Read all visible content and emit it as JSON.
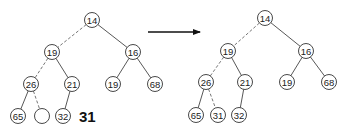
{
  "before_tree": {
    "insert_value": "31",
    "nodes": [
      {
        "id": "a",
        "label": "14",
        "x": 92,
        "y": 20
      },
      {
        "id": "b",
        "label": "19",
        "x": 52,
        "y": 52
      },
      {
        "id": "c",
        "label": "16",
        "x": 133,
        "y": 52
      },
      {
        "id": "d",
        "label": "26",
        "x": 31,
        "y": 84
      },
      {
        "id": "e",
        "label": "21",
        "x": 72,
        "y": 84
      },
      {
        "id": "f",
        "label": "19",
        "x": 113,
        "y": 84
      },
      {
        "id": "g",
        "label": "68",
        "x": 155,
        "y": 84
      },
      {
        "id": "h",
        "label": "65",
        "x": 18,
        "y": 116
      },
      {
        "id": "i",
        "label": "",
        "x": 42,
        "y": 116
      },
      {
        "id": "j",
        "label": "32",
        "x": 63,
        "y": 116
      }
    ],
    "edges": [
      {
        "from": "a",
        "to": "b",
        "dashed": true
      },
      {
        "from": "a",
        "to": "c",
        "dashed": false
      },
      {
        "from": "b",
        "to": "d",
        "dashed": true
      },
      {
        "from": "b",
        "to": "e",
        "dashed": false
      },
      {
        "from": "c",
        "to": "f",
        "dashed": false
      },
      {
        "from": "c",
        "to": "g",
        "dashed": false
      },
      {
        "from": "d",
        "to": "h",
        "dashed": false
      },
      {
        "from": "d",
        "to": "i",
        "dashed": true
      },
      {
        "from": "e",
        "to": "j",
        "dashed": false
      }
    ],
    "label_pos": {
      "x": 79,
      "y": 116
    }
  },
  "arrow": {
    "x1": 148,
    "y1": 32,
    "x2": 200,
    "y2": 32
  },
  "after_tree": {
    "nodes": [
      {
        "id": "a",
        "label": "14",
        "x": 265,
        "y": 18
      },
      {
        "id": "b",
        "label": "19",
        "x": 228,
        "y": 51
      },
      {
        "id": "c",
        "label": "16",
        "x": 306,
        "y": 51
      },
      {
        "id": "d",
        "label": "26",
        "x": 206,
        "y": 82
      },
      {
        "id": "e",
        "label": "21",
        "x": 245,
        "y": 82
      },
      {
        "id": "f",
        "label": "19",
        "x": 287,
        "y": 82
      },
      {
        "id": "g",
        "label": "68",
        "x": 329,
        "y": 82
      },
      {
        "id": "h",
        "label": "65",
        "x": 196,
        "y": 115
      },
      {
        "id": "i",
        "label": "31",
        "x": 218,
        "y": 115
      },
      {
        "id": "j",
        "label": "32",
        "x": 239,
        "y": 115
      }
    ],
    "edges": [
      {
        "from": "a",
        "to": "b",
        "dashed": true
      },
      {
        "from": "a",
        "to": "c",
        "dashed": false
      },
      {
        "from": "b",
        "to": "d",
        "dashed": true
      },
      {
        "from": "b",
        "to": "e",
        "dashed": false
      },
      {
        "from": "c",
        "to": "f",
        "dashed": false
      },
      {
        "from": "c",
        "to": "g",
        "dashed": false
      },
      {
        "from": "d",
        "to": "h",
        "dashed": false
      },
      {
        "from": "d",
        "to": "i",
        "dashed": true
      },
      {
        "from": "e",
        "to": "j",
        "dashed": false
      }
    ]
  },
  "node_radius": 7.5
}
